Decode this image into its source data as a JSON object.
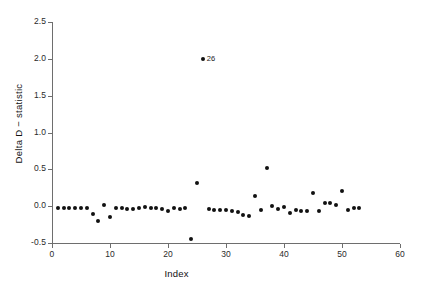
{
  "chart_data": {
    "type": "scatter",
    "title": "",
    "xlabel": "Index",
    "ylabel": "Delta D − statistic",
    "xlim": [
      0,
      60
    ],
    "ylim": [
      -0.5,
      2.5
    ],
    "xticks": [
      0,
      10,
      20,
      30,
      40,
      50,
      60
    ],
    "xtick_labels": [
      "0",
      "10",
      "20",
      "30",
      "40",
      "50",
      "60"
    ],
    "yticks": [
      -0.5,
      0.0,
      0.5,
      1.0,
      1.5,
      2.0,
      2.5
    ],
    "ytick_labels": [
      "-0.5",
      "0.0",
      "0.5",
      "1.0",
      "1.5",
      "2.0",
      "2.5"
    ],
    "grid": false,
    "legend": null,
    "marker": "filled-circle",
    "marker_color": "#111111",
    "axis_color": "#6e6e6e",
    "background": "#ffffff",
    "x": [
      1,
      2,
      3,
      4,
      5,
      6,
      7,
      8,
      9,
      10,
      11,
      12,
      13,
      14,
      15,
      16,
      17,
      18,
      19,
      20,
      21,
      22,
      23,
      24,
      25,
      26,
      27,
      28,
      29,
      30,
      31,
      32,
      33,
      34,
      35,
      36,
      37,
      38,
      39,
      40,
      41,
      42,
      43,
      44,
      45,
      46,
      47,
      48,
      49,
      50,
      51,
      52,
      53
    ],
    "y": [
      -0.02,
      -0.02,
      -0.02,
      -0.02,
      -0.02,
      -0.02,
      -0.1,
      -0.2,
      0.02,
      -0.15,
      -0.03,
      -0.03,
      -0.04,
      -0.04,
      -0.03,
      -0.01,
      -0.03,
      -0.03,
      -0.04,
      -0.07,
      -0.02,
      -0.04,
      -0.02,
      -0.45,
      0.32,
      2.0,
      -0.04,
      -0.05,
      -0.05,
      -0.05,
      -0.07,
      -0.08,
      -0.12,
      -0.13,
      0.14,
      -0.05,
      0.52,
      0.0,
      -0.04,
      -0.01,
      -0.09,
      -0.05,
      -0.06,
      -0.07,
      0.18,
      -0.06,
      0.04,
      0.05,
      0.02,
      0.2,
      -0.05,
      -0.03,
      -0.03
    ],
    "annotations": [
      {
        "label": "26",
        "x": 26,
        "y": 2.0,
        "position": "right"
      }
    ]
  }
}
